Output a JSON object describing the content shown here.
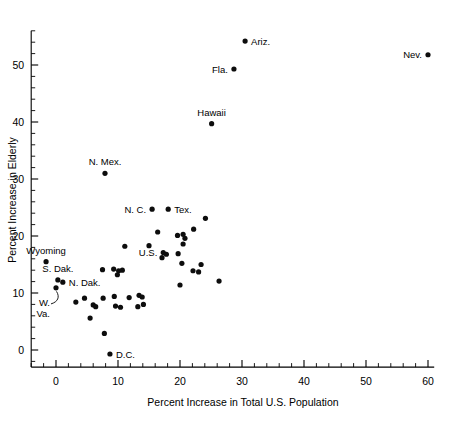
{
  "chart_data": {
    "type": "scatter",
    "title": "",
    "xlabel": "Percent Increase in Total U.S. Population",
    "ylabel": "Percent Increase in Elderly",
    "xlim": [
      -4,
      61
    ],
    "ylim": [
      -3,
      56
    ],
    "x_ticks": [
      0,
      10,
      20,
      30,
      40,
      50,
      60
    ],
    "y_ticks": [
      0,
      10,
      20,
      30,
      40,
      50
    ],
    "x_tick_labels": [
      "0",
      "10",
      "20",
      "30",
      "40",
      "50",
      "60"
    ],
    "y_tick_labels": [
      "0",
      "10",
      "20",
      "30",
      "40",
      "50"
    ],
    "x_minor_step": 2,
    "y_minor_step": 2,
    "grid": false,
    "legend": null,
    "points": [
      {
        "label": "Ariz.",
        "x": 30.5,
        "y": 54.2,
        "label_pos": "right"
      },
      {
        "label": "Nev.",
        "x": 60.0,
        "y": 51.8,
        "label_pos": "left"
      },
      {
        "label": "Fla.",
        "x": 28.7,
        "y": 49.3,
        "label_pos": "left"
      },
      {
        "label": "Hawaii",
        "x": 25.1,
        "y": 39.7,
        "label_pos": "above"
      },
      {
        "label": "N. Mex.",
        "x": 7.9,
        "y": 31.0,
        "label_pos": "above"
      },
      {
        "label": "N. C.",
        "x": 15.5,
        "y": 24.7,
        "label_pos": "left"
      },
      {
        "label": "Tex.",
        "x": 18.1,
        "y": 24.7,
        "label_pos": "right"
      },
      {
        "label": "U.S.",
        "x": 17.3,
        "y": 17.1,
        "label_pos": "left"
      },
      {
        "label": "Wyoming",
        "x": -1.6,
        "y": 15.5,
        "label_pos": "above"
      },
      {
        "label": "S. Dak.",
        "x": 0.3,
        "y": 12.3,
        "label_pos": "above"
      },
      {
        "label": "N. Dak.",
        "x": 1.1,
        "y": 11.9,
        "label_pos": "right"
      },
      {
        "label": "W. Va.",
        "x": 0.0,
        "y": 10.9,
        "label_pos": "callout"
      },
      {
        "label": "D.C.",
        "x": 8.7,
        "y": -0.7,
        "label_pos": "right"
      },
      {
        "label": "",
        "x": 24.1,
        "y": 23.1
      },
      {
        "label": "",
        "x": 22.2,
        "y": 21.2
      },
      {
        "label": "",
        "x": 16.4,
        "y": 20.7
      },
      {
        "label": "",
        "x": 19.6,
        "y": 20.1
      },
      {
        "label": "",
        "x": 20.5,
        "y": 20.3
      },
      {
        "label": "",
        "x": 20.8,
        "y": 19.6
      },
      {
        "label": "",
        "x": 20.5,
        "y": 18.6
      },
      {
        "label": "",
        "x": 11.1,
        "y": 18.2
      },
      {
        "label": "",
        "x": 15.0,
        "y": 18.3
      },
      {
        "label": "",
        "x": 17.8,
        "y": 16.8
      },
      {
        "label": "",
        "x": 19.7,
        "y": 16.9
      },
      {
        "label": "",
        "x": 17.1,
        "y": 16.2
      },
      {
        "label": "",
        "x": 20.3,
        "y": 15.2
      },
      {
        "label": "",
        "x": 23.4,
        "y": 15.0
      },
      {
        "label": "",
        "x": 22.1,
        "y": 13.9
      },
      {
        "label": "",
        "x": 23.0,
        "y": 13.7
      },
      {
        "label": "",
        "x": 7.5,
        "y": 14.1
      },
      {
        "label": "",
        "x": 9.3,
        "y": 14.2
      },
      {
        "label": "",
        "x": 10.1,
        "y": 13.9
      },
      {
        "label": "",
        "x": 10.7,
        "y": 14.0
      },
      {
        "label": "",
        "x": 9.9,
        "y": 13.2
      },
      {
        "label": "",
        "x": 26.3,
        "y": 12.1
      },
      {
        "label": "",
        "x": 20.0,
        "y": 11.4
      },
      {
        "label": "",
        "x": 4.6,
        "y": 9.1
      },
      {
        "label": "",
        "x": 7.6,
        "y": 9.1
      },
      {
        "label": "",
        "x": 9.4,
        "y": 9.4
      },
      {
        "label": "",
        "x": 11.8,
        "y": 9.2
      },
      {
        "label": "",
        "x": 13.4,
        "y": 9.6
      },
      {
        "label": "",
        "x": 13.9,
        "y": 9.3
      },
      {
        "label": "",
        "x": 3.2,
        "y": 8.4
      },
      {
        "label": "",
        "x": 6.0,
        "y": 7.9
      },
      {
        "label": "",
        "x": 6.4,
        "y": 7.6
      },
      {
        "label": "",
        "x": 9.6,
        "y": 7.7
      },
      {
        "label": "",
        "x": 10.4,
        "y": 7.5
      },
      {
        "label": "",
        "x": 13.2,
        "y": 7.6
      },
      {
        "label": "",
        "x": 14.1,
        "y": 8.0
      },
      {
        "label": "",
        "x": 5.5,
        "y": 5.6
      },
      {
        "label": "",
        "x": 7.8,
        "y": 2.9
      }
    ]
  },
  "axes": {
    "x_title": "Percent Increase in Total U.S. Population",
    "y_title": "Percent Increase in Elderly"
  }
}
